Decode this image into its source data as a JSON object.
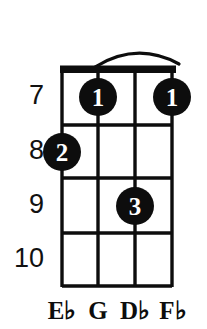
{
  "diagram": {
    "instrument_type": "ukulele-chord-diagram",
    "title": "",
    "fret_numbers": [
      {
        "label": "7",
        "fret": 7,
        "y": 97
      },
      {
        "label": "8",
        "fret": 8,
        "y": 152
      },
      {
        "label": "9",
        "fret": 9,
        "y": 206
      },
      {
        "label": "10",
        "fret": 10,
        "y": 260
      }
    ],
    "string_labels": [
      {
        "letter": "E",
        "accidental": "♭",
        "full": "E♭",
        "string": 1,
        "x": 62
      },
      {
        "letter": "G",
        "accidental": "",
        "full": "G",
        "string": 2,
        "x": 98
      },
      {
        "letter": "D",
        "accidental": "♭",
        "full": "D♭",
        "string": 3,
        "x": 135
      },
      {
        "letter": "F",
        "accidental": "♭",
        "full": "F♭",
        "string": 4,
        "x": 172
      }
    ],
    "finger_dots": [
      {
        "finger": "1",
        "string": 2,
        "fret": 7,
        "cx": 98,
        "cy": 97,
        "r": 19
      },
      {
        "finger": "1",
        "string": 4,
        "fret": 7,
        "cx": 172,
        "cy": 97,
        "r": 19
      },
      {
        "finger": "2",
        "string": 1,
        "fret": 8,
        "cx": 62,
        "cy": 152,
        "r": 19
      },
      {
        "finger": "3",
        "string": 3,
        "fret": 9,
        "cx": 135,
        "cy": 206,
        "r": 19
      }
    ],
    "grid": {
      "left": 62,
      "right": 172,
      "nut_top": 66,
      "nut_bottom": 73,
      "string_x": [
        62,
        98,
        135,
        172
      ],
      "fret_y": [
        73,
        125,
        178,
        233,
        287
      ],
      "string_count": 4,
      "fret_space_count": 4
    },
    "headstock_arc": {
      "start_x": 95,
      "start_y": 66,
      "peak_x": 137,
      "peak_y": 47,
      "end_x": 179,
      "end_y": 63
    },
    "colors": {
      "ink": "#0d0d0d",
      "background": "#ffffff",
      "dot_fill": "#0d0d0d",
      "dot_text": "#ffffff"
    }
  }
}
